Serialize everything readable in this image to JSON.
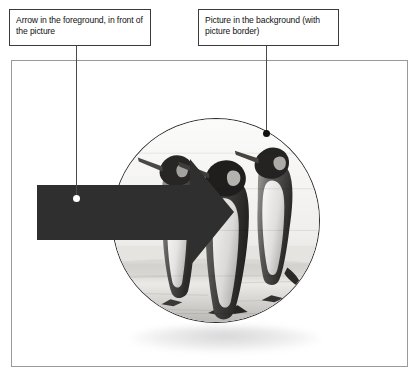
{
  "figure": {
    "callouts": [
      {
        "id": "arrow",
        "text": "Arrow in the foreground, in front of the picture",
        "dot_color": "#ffffff",
        "line_color": "#4a4a4a"
      },
      {
        "id": "picture",
        "text": "Picture in the background (with picture border)",
        "dot_color": "#111111",
        "line_color": "#4a4a4a"
      }
    ],
    "frame": {
      "border_color": "#9a9a9a",
      "background_color": "#ffffff"
    },
    "picture": {
      "shape": "oval",
      "border_color": "#2e2e2e",
      "subject": "black-and-white photograph of three king penguins standing on ice",
      "has_shadow": true
    },
    "arrow": {
      "shape": "right-pointing block arrow",
      "fill_color": "#2f2f2f",
      "direction": "right"
    }
  }
}
